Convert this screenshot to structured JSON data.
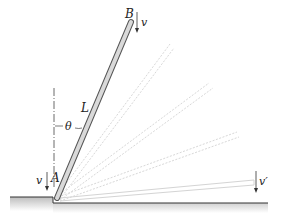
{
  "diagram": {
    "type": "mechanics-rod-sliding",
    "labels": {
      "top_end": "B",
      "bottom_end": "A",
      "length": "L",
      "angle": "θ",
      "velocity_B": "v",
      "velocity_A": "v",
      "velocity_final": "v′"
    },
    "colors": {
      "rod_fill": "#d9d9d9",
      "rod_stroke": "#555555",
      "ghost_stroke": "#dcdcdc",
      "ground_fill": "#bdbdbd",
      "line": "#333333"
    },
    "rod": {
      "pivot": [
        57,
        198
      ],
      "tip": [
        131,
        22
      ]
    },
    "ghost_rods": [
      {
        "tip": [
          172,
          46
        ]
      },
      {
        "tip": [
          211,
          85
        ]
      },
      {
        "tip": [
          238,
          135
        ]
      },
      {
        "tip": [
          254,
          182
        ]
      }
    ]
  }
}
